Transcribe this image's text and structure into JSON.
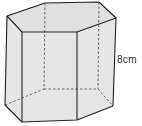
{
  "diagram": {
    "type": "hexagonal-prism",
    "height_label": "8cm",
    "colors": {
      "face": "#e4e4e4",
      "edge": "#222222",
      "hidden_edge": "#555555"
    },
    "vertices": {
      "top": [
        [
          7,
          16
        ],
        [
          45,
          3
        ],
        [
          99,
          2
        ],
        [
          116,
          18
        ],
        [
          77,
          32
        ],
        [
          22,
          32
        ]
      ],
      "bottom": [
        [
          5,
          105
        ],
        [
          44,
          89
        ],
        [
          98,
          89
        ],
        [
          113,
          106
        ],
        [
          77,
          120
        ],
        [
          22,
          122
        ]
      ]
    }
  }
}
